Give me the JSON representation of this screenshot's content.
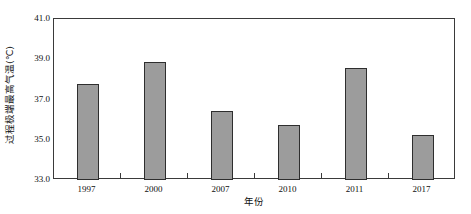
{
  "chart_data": {
    "type": "bar",
    "title": "",
    "xlabel": "年份",
    "ylabel": "过程极端最高气温(℃)",
    "categories": [
      "1997",
      "2000",
      "2007",
      "2010",
      "2011",
      "2017"
    ],
    "values": [
      37.75,
      38.85,
      36.45,
      35.75,
      38.55,
      35.25
    ],
    "ylim": [
      33.0,
      41.0
    ],
    "ytick_labels": [
      "33.0",
      "35.0",
      "37.0",
      "39.0",
      "41.0"
    ],
    "ytick_values": [
      33.0,
      35.0,
      37.0,
      39.0,
      41.0
    ],
    "grid": false,
    "legend": false,
    "legend_position": "none",
    "bar_color": "#9c9c9c",
    "bar_edge_color": "#2e2e2e",
    "axis_color": "#3a3a3a",
    "background_color": "#ffffff"
  }
}
